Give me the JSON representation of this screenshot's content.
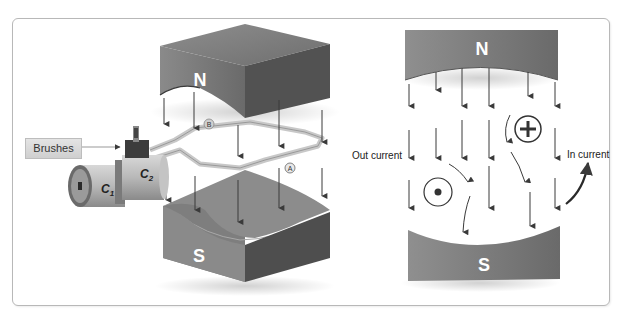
{
  "diagram": {
    "type": "DC motor operating principle",
    "left_panel": {
      "magnet_north_label": "N",
      "magnet_south_label": "S",
      "brushes_label": "Brushes",
      "commutator_segments": [
        "C1",
        "C2"
      ],
      "commutator_c1_main": "C",
      "commutator_c1_sub": "1",
      "commutator_c2_main": "C",
      "commutator_c2_sub": "2",
      "coil_side_labels": [
        "A",
        "B"
      ],
      "coil_side_a": "A",
      "coil_side_b": "B"
    },
    "right_panel": {
      "magnet_north_label": "N",
      "magnet_south_label": "S",
      "out_current_label": "Out current",
      "in_current_label": "In current",
      "out_current_symbol": "dot-in-circle",
      "in_current_symbol": "plus-in-circle"
    },
    "colors": {
      "magnet_dark": "#4a4a4a",
      "magnet_mid": "#7a7a7a",
      "magnet_light": "#a0a0a0",
      "arrow": "#3a3a3a",
      "frame_border": "#b8b8b8"
    }
  }
}
